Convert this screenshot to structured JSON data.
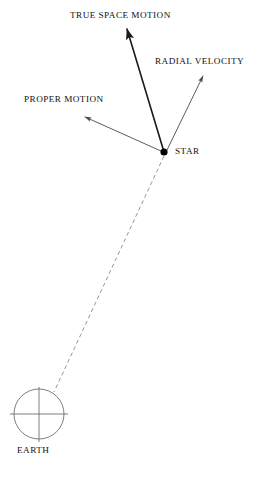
{
  "figure": {
    "background_color": "#ffffff",
    "ink_color": "#111111",
    "sight_line_color": "#8a8a8a",
    "width": 276,
    "height": 479
  },
  "labels": {
    "true_space_motion": "TRUE SPACE MOTION",
    "radial_velocity": "RADIAL VELOCITY",
    "proper_motion": "PROPER MOTION",
    "star": "STAR",
    "earth": "EARTH"
  },
  "nodes": {
    "star": {
      "x": 164,
      "y": 152,
      "radius": 3.6,
      "fill": "#000000"
    },
    "earth": {
      "x": 39,
      "y": 414,
      "radius": 25,
      "stroke": "#6f6f6f"
    }
  },
  "vectors": [
    {
      "name": "true-space-motion",
      "label": "TRUE SPACE MOTION",
      "from_x": 164,
      "from_y": 152,
      "to_x": 127,
      "to_y": 29,
      "stroke": "#1a1a1a",
      "stroke_width": 1.6,
      "arrowhead": true
    },
    {
      "name": "radial-velocity",
      "label": "RADIAL VELOCITY",
      "from_x": 167,
      "from_y": 150,
      "to_x": 203,
      "to_y": 76,
      "stroke": "#4a4a4a",
      "stroke_width": 0.9,
      "arrowhead": true
    },
    {
      "name": "proper-motion",
      "label": "PROPER MOTION",
      "from_x": 161,
      "from_y": 151,
      "to_x": 85,
      "to_y": 117,
      "stroke": "#4a4a4a",
      "stroke_width": 0.9,
      "arrowhead": true
    }
  ],
  "sight_line": {
    "name": "earth-star-line-of-sight",
    "from_x": 164,
    "from_y": 156,
    "to_x": 54,
    "to_y": 392,
    "stroke": "#8a8a8a",
    "stroke_width": 0.9,
    "dash": "4 3"
  },
  "earth_crosshair": {
    "horizontal": {
      "x1": 10,
      "y1": 414,
      "x2": 68,
      "y2": 414
    },
    "vertical": {
      "x1": 39,
      "y1": 387,
      "x2": 39,
      "y2": 442
    },
    "stroke": "#6f6f6f",
    "stroke_width": 0.9
  }
}
